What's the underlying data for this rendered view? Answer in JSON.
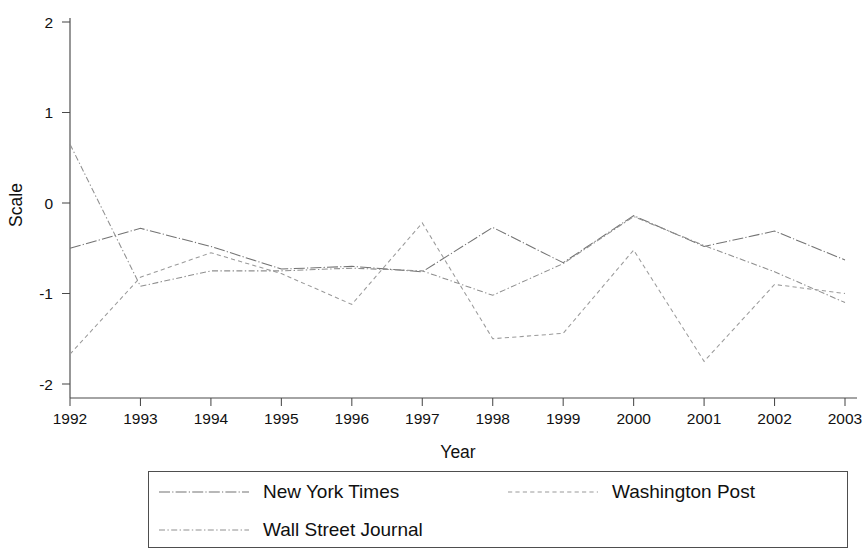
{
  "chart_data": {
    "type": "line",
    "title": "",
    "xlabel": "Year",
    "ylabel": "Scale",
    "x": [
      1992,
      1993,
      1994,
      1995,
      1996,
      1997,
      1998,
      1999,
      2000,
      2001,
      2002,
      2003
    ],
    "categories": [
      "1992",
      "1993",
      "1994",
      "1995",
      "1996",
      "1997",
      "1998",
      "1999",
      "2000",
      "2001",
      "2002",
      "2003"
    ],
    "xlim": [
      1992,
      2003
    ],
    "ylim": [
      -2,
      2
    ],
    "yticks": [
      2,
      1,
      0,
      -1,
      -2
    ],
    "ytick_labels": [
      "2",
      "1",
      "0",
      "-1",
      "-2"
    ],
    "xticks": [
      1992,
      1993,
      1994,
      1995,
      1996,
      1997,
      1998,
      1999,
      2000,
      2001,
      2002,
      2003
    ],
    "xtick_labels": [
      "1992",
      "1993",
      "1994",
      "1995",
      "1996",
      "1997",
      "1998",
      "1999",
      "2000",
      "2001",
      "2002",
      "2003"
    ],
    "grid": false,
    "legend_position": "below",
    "series": [
      {
        "name": "New York Times",
        "line_style": "long-dash-dot",
        "color": "#737373",
        "values": [
          -0.5,
          -0.28,
          -0.48,
          -0.73,
          -0.7,
          -0.76,
          -0.27,
          -0.66,
          -0.14,
          -0.48,
          -0.31,
          -0.63
        ]
      },
      {
        "name": "Wall Street Journal",
        "line_style": "dash-dot",
        "color": "#8f8f8f",
        "values": [
          0.65,
          -0.92,
          -0.75,
          -0.75,
          -0.72,
          -0.75,
          -1.02,
          -0.67,
          -0.15,
          -0.47,
          -0.76,
          -1.1
        ]
      },
      {
        "name": "Washington Post",
        "line_style": "dashed",
        "color": "#9a9a9a",
        "values": [
          -1.67,
          -0.82,
          -0.55,
          -0.78,
          -1.12,
          -0.22,
          -1.5,
          -1.44,
          -0.52,
          -1.75,
          -0.9,
          -1.0
        ]
      }
    ]
  },
  "axes": {
    "y_title": "Scale",
    "x_title": "Year"
  },
  "legend": {
    "entries": [
      {
        "label": "New York Times",
        "swatch": "legend-line-nyt"
      },
      {
        "label": "Washington Post",
        "swatch": "legend-line-wapo"
      },
      {
        "label": "Wall Street Journal",
        "swatch": "legend-line-wsj"
      }
    ]
  },
  "colors": {
    "axis": "#4a4a4a",
    "text": "#111111",
    "background": "#ffffff",
    "legend_border": "#4e4e4e"
  }
}
